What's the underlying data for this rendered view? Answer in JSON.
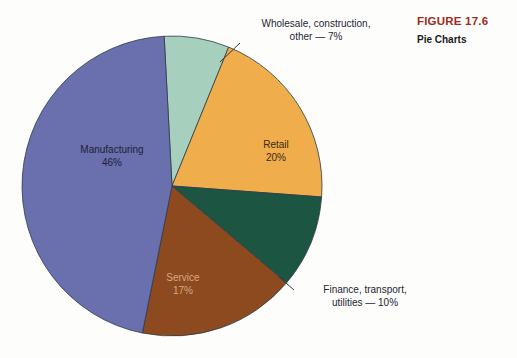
{
  "figure": {
    "number": "FIGURE 17.6",
    "title": "Pie Charts",
    "number_color": "#9e2b20",
    "title_color": "#1a1a1a"
  },
  "labels": {
    "manufacturing": {
      "name": "Manufacturing",
      "percent": "46%"
    },
    "retail": {
      "name": "Retail",
      "percent": "20%"
    },
    "service": {
      "name": "Service",
      "percent": "17%"
    },
    "wholesale_line1": "Wholesale, construction,",
    "wholesale_line2": "other — 7%",
    "finance_line1": "Finance, transport,",
    "finance_line2": "utilities — 10%"
  },
  "chart_data": {
    "type": "pie",
    "title": "Pie Charts",
    "subtitle": "FIGURE 17.6",
    "xlabel": "",
    "ylabel": "",
    "legend_position": "none",
    "grid": false,
    "total": 100,
    "units": "percent",
    "start_angle_deg": -3,
    "direction": "clockwise",
    "categories": [
      "Wholesale, construction, other",
      "Retail",
      "Finance, transport, utilities",
      "Service",
      "Manufacturing"
    ],
    "values": [
      7,
      20,
      10,
      17,
      46
    ],
    "colors": [
      "#a6cfbd",
      "#efad4c",
      "#1d5543",
      "#8d4a1f",
      "#6a6fae"
    ],
    "labels_in_slice": [
      "Retail 20%",
      "Service 17%",
      "Manufacturing 46%"
    ],
    "labels_callout": [
      "Wholesale, construction, other — 7%",
      "Finance, transport, utilities — 10%"
    ],
    "slices": [
      {
        "label": "Wholesale, construction, other",
        "value": 7,
        "color": "#a6cfbd",
        "label_style": "callout"
      },
      {
        "label": "Retail",
        "value": 20,
        "color": "#efad4c",
        "label_style": "inside"
      },
      {
        "label": "Finance, transport, utilities",
        "value": 10,
        "color": "#1d5543",
        "label_style": "callout"
      },
      {
        "label": "Service",
        "value": 17,
        "color": "#8d4a1f",
        "label_style": "inside"
      },
      {
        "label": "Manufacturing",
        "value": 46,
        "color": "#6a6fae",
        "label_style": "inside"
      }
    ]
  }
}
